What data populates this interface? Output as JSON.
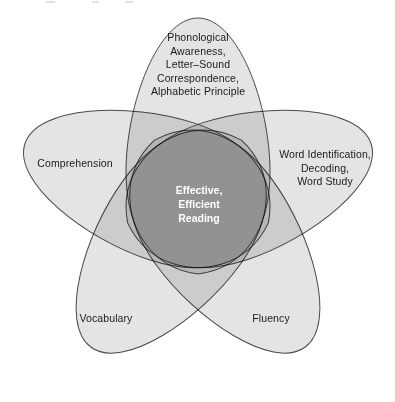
{
  "figure": {
    "name": "effective-efficient-reading-venn",
    "type": "five-petal-venn-diagram",
    "center_label": "Effective,\nEfficient\nReading",
    "petal_count": 5,
    "colors": {
      "petal_fill": "#e4e4e4",
      "petal_stroke": "#4a4a4a",
      "two_way_overlap": "#9a9a9a",
      "center_overlap": "#3d3d3d",
      "label_text": "#1a1a1a",
      "center_text": "#ffffff",
      "background": "#ffffff"
    },
    "petals": [
      {
        "id": "phonological-awareness",
        "label": "Phonological\nAwareness,\nLetter–Sound\nCorrespondence,\nAlphabetic Principle",
        "position": "top",
        "angle_deg": 0
      },
      {
        "id": "word-identification",
        "label": "Word Identification,\nDecoding,\nWord Study",
        "position": "right",
        "angle_deg": 72
      },
      {
        "id": "fluency",
        "label": "Fluency",
        "position": "bottom-right",
        "angle_deg": 144
      },
      {
        "id": "vocabulary",
        "label": "Vocabulary",
        "position": "bottom-left",
        "angle_deg": 216
      },
      {
        "id": "comprehension",
        "label": "Comprehension",
        "position": "left",
        "angle_deg": 288
      }
    ]
  }
}
